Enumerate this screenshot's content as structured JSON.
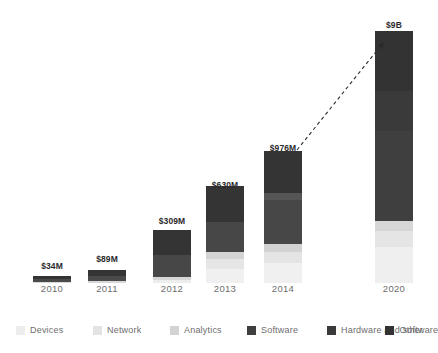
{
  "chart_data": {
    "type": "bar",
    "title": "",
    "subtitle": "",
    "xlabel": "",
    "ylabel": "",
    "stacked": true,
    "grid": false,
    "axis": {
      "y_visible": false,
      "x_visible": false,
      "note": "No y-axis drawn; bar heights are illustrative and non-linear"
    },
    "legend": {
      "position": "bottom",
      "entries": [
        {
          "name": "Devices",
          "color": "#ededed"
        },
        {
          "name": "Network",
          "color": "#e3e3e3"
        },
        {
          "name": "Analytics",
          "color": "#d3d3d3"
        },
        {
          "name": "Software",
          "color": "#3f3f3f"
        },
        {
          "name": "Hardware and software",
          "color": "#3a3a3a"
        },
        {
          "name": "Other",
          "color": "#333333"
        }
      ]
    },
    "categories": [
      "2010",
      "2011",
      "2012",
      "2013",
      "2014",
      "2020"
    ],
    "value_labels": [
      "$34M",
      "$89M",
      "$309M",
      "$630M",
      "$976M",
      "$9B"
    ],
    "values": [
      34,
      89,
      309,
      630,
      976,
      9000
    ],
    "value_unit": "USD millions",
    "series": [
      {
        "name": "Devices",
        "color": "#ededed",
        "values": [
          0,
          0,
          0,
          0,
          0,
          0
        ]
      },
      {
        "name": "Network",
        "color": "#e3e3e3",
        "values": [
          0,
          0,
          0,
          0,
          0,
          0
        ]
      },
      {
        "name": "Analytics",
        "color": "#d3d3d3",
        "values": [
          0,
          0,
          0,
          0,
          0,
          0
        ]
      },
      {
        "name": "Software",
        "color": "#3f3f3f",
        "values": [
          0,
          0,
          0,
          0,
          0,
          0
        ]
      },
      {
        "name": "Hardware and software",
        "color": "#3a3a3a",
        "values": [
          0,
          0,
          0,
          0,
          0,
          0
        ]
      },
      {
        "name": "Other",
        "color": "#333333",
        "values": [
          0,
          0,
          0,
          0,
          0,
          0
        ]
      }
    ],
    "bars": [
      {
        "category": "2010",
        "label": "$34M",
        "total_px": 7,
        "center_px": 52,
        "label_top_px": 261,
        "segments": [
          {
            "name": "Analytics",
            "color": "#d8d8d8",
            "height_px": 1
          },
          {
            "name": "Software",
            "color": "#4a4a4a",
            "height_px": 3
          },
          {
            "name": "Other",
            "color": "#343434",
            "height_px": 3
          }
        ]
      },
      {
        "category": "2011",
        "label": "$89M",
        "total_px": 13,
        "center_px": 107,
        "label_top_px": 254,
        "segments": [
          {
            "name": "Analytics",
            "color": "#d8d8d8",
            "height_px": 2
          },
          {
            "name": "Software",
            "color": "#4a4a4a",
            "height_px": 5
          },
          {
            "name": "Other",
            "color": "#343434",
            "height_px": 6
          }
        ]
      },
      {
        "category": "2012",
        "label": "$309M",
        "total_px": 53,
        "center_px": 172,
        "label_top_px": 216,
        "segments": [
          {
            "name": "Devices",
            "color": "#ededed",
            "height_px": 3
          },
          {
            "name": "Analytics",
            "color": "#d6d6d6",
            "height_px": 3
          },
          {
            "name": "Software",
            "color": "#474747",
            "height_px": 22
          },
          {
            "name": "Other",
            "color": "#343434",
            "height_px": 25
          }
        ]
      },
      {
        "category": "2013",
        "label": "$630M",
        "total_px": 97,
        "center_px": 225,
        "label_top_px": 180,
        "segments": [
          {
            "name": "Devices",
            "color": "#f0f0f0",
            "height_px": 14
          },
          {
            "name": "Network",
            "color": "#e6e6e6",
            "height_px": 10
          },
          {
            "name": "Analytics",
            "color": "#d4d4d4",
            "height_px": 7
          },
          {
            "name": "Software",
            "color": "#474747",
            "height_px": 30
          },
          {
            "name": "Other",
            "color": "#343434",
            "height_px": 36
          }
        ]
      },
      {
        "category": "2014",
        "label": "$976M",
        "total_px": 132,
        "center_px": 283,
        "label_top_px": 143,
        "segments": [
          {
            "name": "Devices",
            "color": "#f0f0f0",
            "height_px": 20
          },
          {
            "name": "Network",
            "color": "#e4e4e4",
            "height_px": 11
          },
          {
            "name": "Analytics",
            "color": "#d2d2d2",
            "height_px": 8
          },
          {
            "name": "Software",
            "color": "#474747",
            "height_px": 44
          },
          {
            "name": "Hardware and software",
            "color": "#555555",
            "height_px": 7
          },
          {
            "name": "Other",
            "color": "#343434",
            "height_px": 42
          }
        ]
      },
      {
        "category": "2020",
        "label": "$9B",
        "total_px": 252,
        "center_px": 394,
        "label_top_px": 20,
        "segments": [
          {
            "name": "Devices",
            "color": "#efefef",
            "height_px": 36
          },
          {
            "name": "Network",
            "color": "#e5e5e5",
            "height_px": 16
          },
          {
            "name": "Analytics",
            "color": "#d6d6d6",
            "height_px": 10
          },
          {
            "name": "Software",
            "color": "#3f3f3f",
            "height_px": 90
          },
          {
            "name": "Hardware and software",
            "color": "#3a3a3a",
            "height_px": 40
          },
          {
            "name": "Other",
            "color": "#333333",
            "height_px": 60
          }
        ]
      }
    ],
    "annotations": [
      {
        "type": "dashed-arrow",
        "name": "growth-projection-arrow",
        "from_px": [
          297,
          150
        ],
        "to_px": [
          384,
          42
        ],
        "color": "#2b2b2b",
        "style": "dashed",
        "arrowhead": "end"
      }
    ]
  },
  "colors": {
    "bar_dark": "#343434",
    "bar_mid": "#474747",
    "bar_light": "#ededed",
    "label_text": "#2b2b2b",
    "axis_text": "#6e6e6e",
    "background": "#ffffff"
  }
}
